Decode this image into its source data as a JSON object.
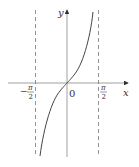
{
  "figure": {
    "function": "tan x",
    "axes": {
      "x_label": "x",
      "y_label": "y",
      "origin_label": "0"
    },
    "asymptotes": [
      {
        "label_sign": "−",
        "label_num": "π",
        "label_den": "2"
      },
      {
        "label_sign": "",
        "label_num": "π",
        "label_den": "2"
      }
    ],
    "colors": {
      "axis": "#888888",
      "curve": "#444444",
      "asymptote": "#777777"
    }
  }
}
